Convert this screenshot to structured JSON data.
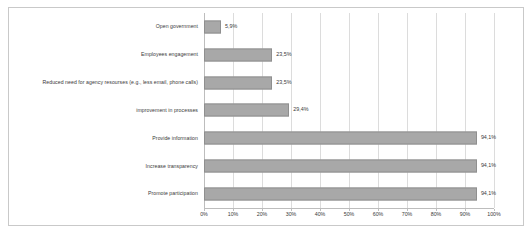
{
  "chart_data": {
    "type": "bar",
    "orientation": "horizontal",
    "title": "",
    "subtitle": "",
    "xlabel": "",
    "ylabel": "",
    "xlim": [
      0,
      100
    ],
    "grid": true,
    "legend": false,
    "categories": [
      "Open government",
      "Employees engagement",
      "Reduced need for agency resourses (e.g., less email, phone calls)",
      "improvement in processes",
      "Provide information",
      "Increase transparency",
      "Promote participation"
    ],
    "values": [
      5.9,
      23.5,
      23.5,
      29.4,
      94.1,
      94.1,
      94.1
    ],
    "data_labels": [
      "5,9%",
      "23,5%",
      "23,5%",
      "29,4%",
      "94,1%",
      "94,1%",
      "94,1%"
    ],
    "xticks": [
      0,
      10,
      20,
      30,
      40,
      50,
      60,
      70,
      80,
      90,
      100
    ],
    "xtick_labels": [
      "0%",
      "10%",
      "20%",
      "30%",
      "40%",
      "50%",
      "60%",
      "70%",
      "80%",
      "90%",
      "100%"
    ],
    "bar_color": "#a8a8a8",
    "bar_border_color": "#8f8f8f",
    "grid_color": "#dcdcdc",
    "axis_color": "#bdbdbd",
    "text_color": "#3a3a3a",
    "frame_color": "#c9c9c9"
  }
}
